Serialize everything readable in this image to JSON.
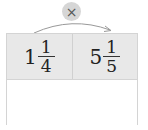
{
  "operator": {
    "symbol": "×",
    "icon": "multiply-icon"
  },
  "arrow": {
    "from": "left-cell",
    "to": "right-cell"
  },
  "table": {
    "top_row": [
      {
        "whole": "1",
        "numerator": "1",
        "denominator": "4"
      },
      {
        "whole": "5",
        "numerator": "1",
        "denominator": "5"
      }
    ],
    "bottom_row": [
      {
        "value": ""
      }
    ]
  },
  "colors": {
    "top_row_bg": "#e8e8e8",
    "operator_bg": "#d6d6d6",
    "border": "#d4d4d4"
  }
}
